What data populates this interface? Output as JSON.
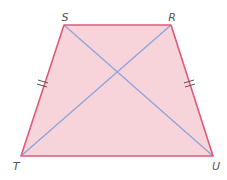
{
  "figure": {
    "type": "isosceles-trapezium",
    "vertices": [
      {
        "label": "S",
        "x": 64,
        "y": 25,
        "lx": 65,
        "ly": 21
      },
      {
        "label": "R",
        "x": 171,
        "y": 25,
        "lx": 172,
        "ly": 21
      },
      {
        "label": "T",
        "x": 21,
        "y": 156,
        "lx": 16,
        "ly": 170
      },
      {
        "label": "U",
        "x": 213,
        "y": 156,
        "lx": 216,
        "ly": 170
      }
    ],
    "diagonals": [
      [
        "S",
        "U"
      ],
      [
        "R",
        "T"
      ]
    ],
    "equal_sides_marks": [
      {
        "side": "ST",
        "marks": 2
      },
      {
        "side": "RU",
        "marks": 2
      }
    ],
    "colors": {
      "fill": "#f7d3da",
      "outline": "#e05a78",
      "diagonal": "#8fa3dc",
      "tick": "#555555",
      "label": "#555555"
    }
  }
}
